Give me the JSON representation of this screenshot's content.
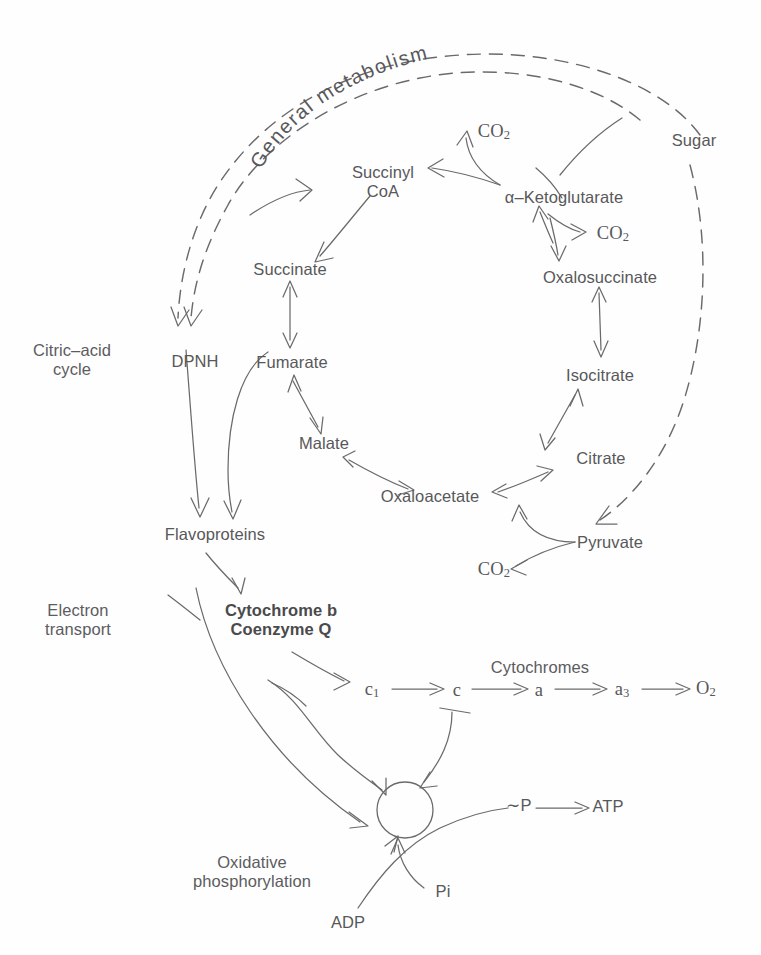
{
  "figure": {
    "title": "General metabolism",
    "arc_label": "General metabolism",
    "text_color": "#58585a",
    "line_color": "#6a6a6c",
    "background": "#ffffff"
  },
  "section_labels": {
    "citric_acid_cycle": "Citric–acid\ncycle",
    "electron_transport": "Electron\ntransport",
    "oxidative_phosphorylation": "Oxidative\nphosphorylation",
    "cytochromes": "Cytochromes"
  },
  "nodes": {
    "sugar": "Sugar",
    "pyruvate": "Pyruvate",
    "citrate": "Citrate",
    "isocitrate": "Isocitrate",
    "oxalosuccinate": "Oxalosuccinate",
    "ketoglutarate": "α–Ketoglutarate",
    "succinyl_coa": "Succinyl\nCoA",
    "succinate": "Succinate",
    "fumarate": "Fumarate",
    "malate": "Malate",
    "oxaloacetate": "Oxaloacetate",
    "dpnh": "DPNH",
    "flavoproteins": "Flavoproteins",
    "cytochrome_b_coq": "Cytochrome b\nCoenzyme Q",
    "cyt_c1": "c",
    "cyt_c1_sub": "1",
    "cyt_c": "c",
    "cyt_a": "a",
    "cyt_a3": "a",
    "cyt_a3_sub": "3",
    "oxygen": "O",
    "oxygen_sub": "2",
    "co2_ketoglutarate": "CO",
    "co2_ketoglutarate_sub": "2",
    "co2_oxalosuccinate": "CO",
    "co2_oxalosuccinate_sub": "2",
    "co2_pyruvate": "CO",
    "co2_pyruvate_sub": "2",
    "high_energy_phosphate": "∼P",
    "atp": "ATP",
    "adp": "ADP",
    "pi": "Pi"
  },
  "pathway_edges": [
    {
      "from": "Sugar",
      "to": "Pyruvate",
      "style": "dashed"
    },
    {
      "from": "Pyruvate",
      "to": "Oxaloacetate",
      "style": "solid"
    },
    {
      "from": "Pyruvate",
      "to": "CO2",
      "style": "solid"
    },
    {
      "from": "Oxaloacetate",
      "to": "Citrate",
      "style": "solid"
    },
    {
      "from": "Citrate",
      "to": "Isocitrate",
      "style": "solid-double"
    },
    {
      "from": "Isocitrate",
      "to": "Oxalosuccinate",
      "style": "solid-double"
    },
    {
      "from": "Oxalosuccinate",
      "to": "α-Ketoglutarate",
      "style": "solid-double"
    },
    {
      "from": "α-Ketoglutarate",
      "to": "CO2",
      "style": "solid"
    },
    {
      "from": "α-Ketoglutarate",
      "to": "Succinyl CoA",
      "style": "solid"
    },
    {
      "from": "Succinyl CoA",
      "to": "Succinate",
      "style": "solid"
    },
    {
      "from": "Succinate",
      "to": "Fumarate",
      "style": "solid-double"
    },
    {
      "from": "Fumarate",
      "to": "Malate",
      "style": "solid-double"
    },
    {
      "from": "Malate",
      "to": "Oxaloacetate",
      "style": "solid-double"
    },
    {
      "from": "Citric-acid cycle",
      "to": "DPNH",
      "style": "dashed"
    },
    {
      "from": "DPNH",
      "to": "Flavoproteins",
      "style": "solid"
    },
    {
      "from": "Fumarate",
      "to": "Flavoproteins",
      "style": "solid"
    },
    {
      "from": "Flavoproteins",
      "to": "Cytochrome b / Coenzyme Q",
      "style": "solid"
    },
    {
      "from": "Cytochrome b / Coenzyme Q",
      "to": "c1",
      "style": "solid"
    },
    {
      "from": "c1",
      "to": "c",
      "style": "solid"
    },
    {
      "from": "c",
      "to": "a",
      "style": "solid"
    },
    {
      "from": "a",
      "to": "a3",
      "style": "solid"
    },
    {
      "from": "a3",
      "to": "O2",
      "style": "solid"
    },
    {
      "from": "Flavoproteins",
      "to": "coupling site",
      "style": "solid"
    },
    {
      "from": "c1 region",
      "to": "coupling site",
      "style": "solid"
    },
    {
      "from": "c region",
      "to": "coupling site",
      "style": "solid"
    },
    {
      "from": "ADP",
      "to": "coupling site",
      "style": "solid"
    },
    {
      "from": "Pi",
      "to": "coupling site",
      "style": "solid"
    },
    {
      "from": "coupling site",
      "to": "∼P",
      "style": "solid"
    },
    {
      "from": "∼P",
      "to": "ATP",
      "style": "solid"
    }
  ]
}
